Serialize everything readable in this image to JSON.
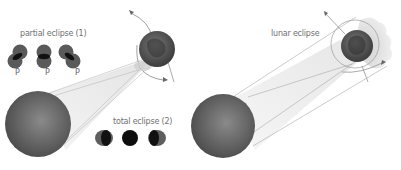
{
  "left_panel": {
    "partial_label": "partial eclipse (1)",
    "total_label": "total eclipse (2)",
    "partial_markers": [
      "P",
      "P",
      "P"
    ],
    "bodies": [
      "sun",
      "earth",
      "moon"
    ]
  },
  "right_panel": {
    "lunar_label": "lunar eclipse",
    "bodies": [
      "sun",
      "earth",
      "moon"
    ]
  },
  "colors": {
    "sun": "#6a6a6a",
    "earth": "#5a5a5a",
    "shadow_disk": "#111111",
    "label": "#707070",
    "lines": "#9a9a9a"
  }
}
